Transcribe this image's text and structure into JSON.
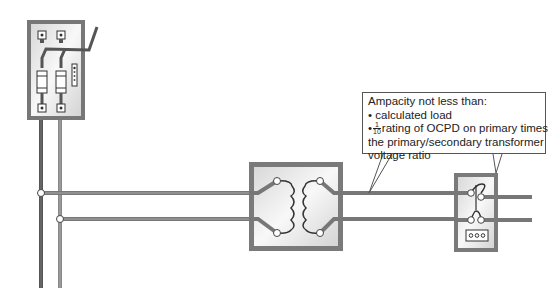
{
  "diagram": {
    "components": [
      {
        "id": "disconnect",
        "label": "Fused disconnect switch"
      },
      {
        "id": "transformer",
        "label": "Transformer"
      },
      {
        "id": "panel",
        "label": "Secondary panel"
      }
    ],
    "callout": {
      "heading": "Ampacity not less than:",
      "bullet1": "calculated load",
      "bullet2_frac_num": "1",
      "bullet2_frac_den": "10",
      "bullet2_text": "rating of OCPD on primary times",
      "line4": "the primary/secondary transformer",
      "line5": "voltage ratio",
      "bullet": "•"
    },
    "colors": {
      "wire": "#6e6e6e",
      "wire_dark": "#4a4a4a",
      "box_border": "#7a7a7a",
      "box_fill": "#ececec"
    }
  }
}
